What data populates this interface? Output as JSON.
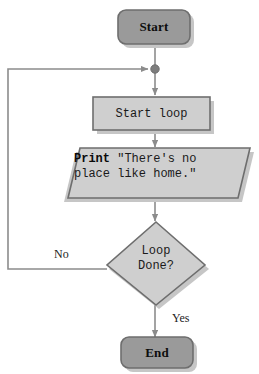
{
  "diagram": {
    "type": "flowchart",
    "palette": {
      "terminator_fill": "#9a9a9a",
      "process_fill": "#cfcfcf",
      "border": "#6e6e6e",
      "connector": "#8c8c8c",
      "shadow": "#c6c6c6",
      "background": "#ffffff",
      "text": "#1a1a1a"
    },
    "nodes": [
      {
        "id": "start",
        "shape": "terminator",
        "label": "Start"
      },
      {
        "id": "merge",
        "shape": "junction-dot",
        "label": ""
      },
      {
        "id": "loop",
        "shape": "process",
        "label": "Start loop"
      },
      {
        "id": "print",
        "shape": "parallelogram",
        "keyword": "Print",
        "line1_rest": " \"There's no",
        "line2": "place like home.\"",
        "full_text": "Print \"There's no place like home.\""
      },
      {
        "id": "decide",
        "shape": "decision",
        "line1": "Loop",
        "line2": "Done?",
        "full_text": "Loop Done?"
      },
      {
        "id": "end",
        "shape": "terminator",
        "label": "End"
      }
    ],
    "edges": [
      {
        "from": "start",
        "to": "merge",
        "label": ""
      },
      {
        "from": "merge",
        "to": "loop",
        "label": ""
      },
      {
        "from": "loop",
        "to": "print",
        "label": ""
      },
      {
        "from": "print",
        "to": "decide",
        "label": ""
      },
      {
        "from": "decide",
        "to": "end",
        "label": "Yes"
      },
      {
        "from": "decide",
        "to": "merge",
        "label": "No"
      }
    ],
    "edge_labels": {
      "no": "No",
      "yes": "Yes"
    }
  }
}
